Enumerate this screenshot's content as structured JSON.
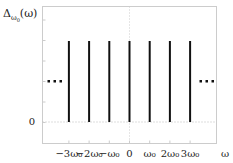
{
  "chart_data": {
    "type": "stem",
    "title": "",
    "ylabel": "Δ_{ω0}(ω)",
    "ylabel_main": "Δ",
    "ylabel_sub": "ω",
    "ylabel_subsub": "0",
    "ylabel_arg": "(ω)",
    "xlabel": "ω",
    "x_ticks": [
      "−3ω₀",
      "−2ω₀",
      "−ω₀",
      "0",
      "ω₀",
      "2ω₀",
      "3ω₀"
    ],
    "x_values": [
      -3,
      -2,
      -1,
      0,
      1,
      2,
      3
    ],
    "values": [
      1,
      1,
      1,
      1,
      1,
      1,
      1
    ],
    "y_ticks": [
      "0"
    ],
    "ylim": [
      0,
      1.4
    ],
    "xlim": [
      -4.3,
      4.3
    ],
    "continuation": "...",
    "grid": "dotted at zero",
    "legend": "none"
  }
}
